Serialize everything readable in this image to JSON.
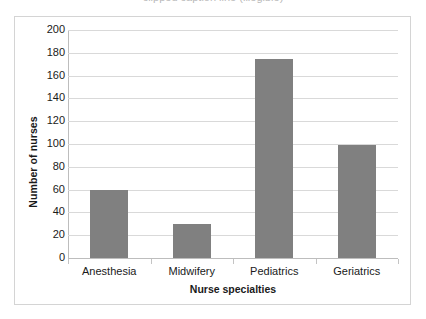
{
  "top_caption": {
    "text": "clipped caption line (illegible)"
  },
  "chart_data": {
    "type": "bar",
    "title": "",
    "categories": [
      "Anesthesia",
      "Midwifery",
      "Pediatrics",
      "Geriatrics"
    ],
    "values": [
      60,
      30,
      175,
      99
    ],
    "xlabel": "Nurse specialties",
    "ylabel": "Number of nurses",
    "ylim": [
      0,
      200
    ],
    "ytick_interval": 20,
    "yticks": [
      0,
      20,
      40,
      60,
      80,
      100,
      120,
      140,
      160,
      180,
      200
    ],
    "ytick_labels": [
      "0",
      "20",
      "40",
      "60",
      "80",
      "100",
      "120",
      "140",
      "160",
      "180",
      "200"
    ],
    "grid": "horizontal",
    "legend": "none",
    "bar_color": "#808080",
    "gridline_color": "#d9d9d9",
    "axis_color": "#bdbdbd",
    "plot_background": "#ffffff",
    "border_color": "#d4d4d4"
  }
}
